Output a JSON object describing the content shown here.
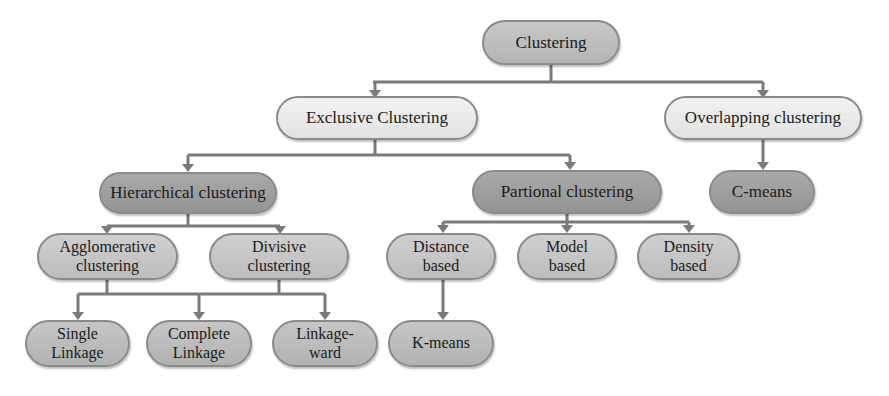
{
  "diagram": {
    "root": {
      "label": "Clustering"
    },
    "level1": {
      "exclusive": {
        "label": "Exclusive Clustering"
      },
      "overlapping": {
        "label": "Overlapping clustering"
      }
    },
    "level2": {
      "hierarchical": {
        "label": "Hierarchical clustering"
      },
      "partional": {
        "label": "Partional clustering"
      },
      "cmeans": {
        "label": "C-means"
      }
    },
    "level3": {
      "agglomerative": {
        "label": "Agglomerative\nclustering"
      },
      "divisive": {
        "label": "Divisive\nclustering"
      },
      "distance": {
        "label": "Distance\nbased"
      },
      "model": {
        "label": "Model\nbased"
      },
      "density": {
        "label": "Density\nbased"
      }
    },
    "level4": {
      "single": {
        "label": "Single\nLinkage"
      },
      "complete": {
        "label": "Complete\nLinkage"
      },
      "ward": {
        "label": "Linkage-\nward"
      },
      "kmeans": {
        "label": "K-means"
      }
    },
    "colors": {
      "edge": "#7a7a7a",
      "root_fill": "#bebebe",
      "level1_fill": "#e9e9e9",
      "level2_fill": "#9e9e9e",
      "leaf_fill": "#c4c4c4"
    }
  }
}
